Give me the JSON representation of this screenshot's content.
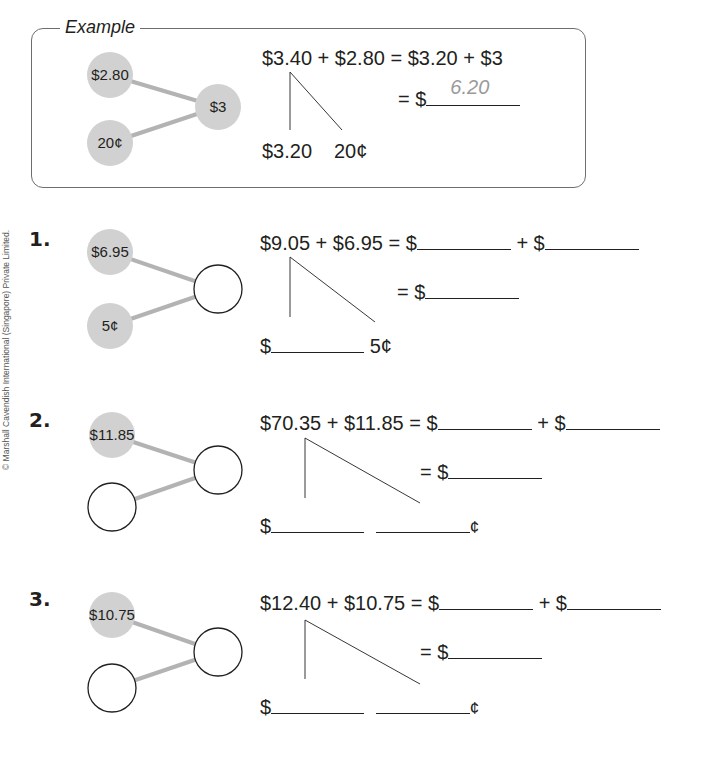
{
  "copyright": "© Marshall Cavendish International (Singapore) Private Limited.",
  "example": {
    "title": "Example",
    "bond": {
      "top": "$2.80",
      "bottom": "20¢",
      "whole": "$3"
    },
    "equation": "$3.40 + $2.80 = $3.20 + $3",
    "result_prefix": "= $",
    "result_answer": "6.20",
    "split_left": "$3.20",
    "split_right": "20¢"
  },
  "problems": [
    {
      "number": "1.",
      "bond": {
        "top": "$6.95",
        "bottom": "5¢",
        "whole": ""
      },
      "equation_left": "$9.05 + $6.95 = $",
      "equation_plus": "+ $",
      "result_prefix": "= $",
      "split_left_prefix": "$",
      "split_right": "5¢"
    },
    {
      "number": "2.",
      "bond": {
        "top": "$11.85",
        "bottom": "",
        "whole": ""
      },
      "equation_left": "$70.35 + $11.85 = $",
      "equation_plus": "+ $",
      "result_prefix": "= $",
      "split_left_prefix": "$",
      "split_right_suffix": "¢"
    },
    {
      "number": "3.",
      "bond": {
        "top": "$10.75",
        "bottom": "",
        "whole": ""
      },
      "equation_left": "$12.40 + $10.75 = $",
      "equation_plus": "+ $",
      "result_prefix": "= $",
      "split_left_prefix": "$",
      "split_right_suffix": "¢"
    }
  ],
  "colors": {
    "filled_circle": "#d1d1d1",
    "connector": "#b3b3b3",
    "answer_text": "#9a9a9a",
    "ink": "#231f20"
  }
}
